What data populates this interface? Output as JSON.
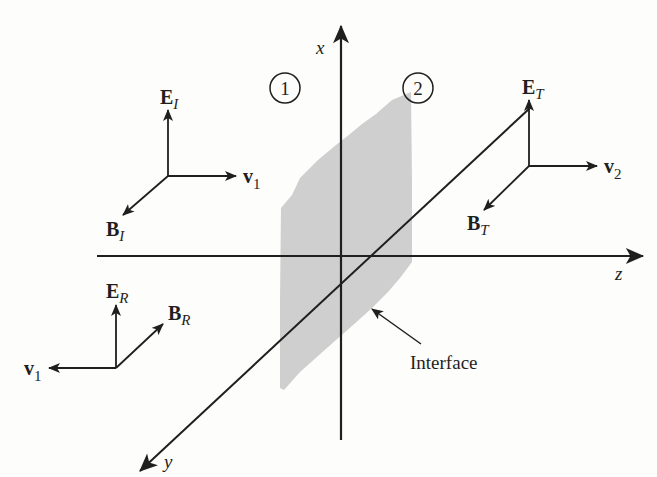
{
  "figure": {
    "colors": {
      "ink": "#1f1f1f",
      "interface_fill": "#cfcfcf",
      "background": "#fdfdfb"
    },
    "axes": {
      "x_label": "x",
      "y_label": "y",
      "z_label": "z"
    },
    "regions": {
      "medium1": "1",
      "medium2": "2"
    },
    "interface_label": "Interface",
    "incident": {
      "E_main": "E",
      "E_sub": "I",
      "B_main": "B",
      "B_sub": "I",
      "v_main": "v",
      "v_sub": "1"
    },
    "reflected": {
      "E_main": "E",
      "E_sub": "R",
      "B_main": "B",
      "B_sub": "R",
      "v_main": "v",
      "v_sub": "1"
    },
    "transmitted": {
      "E_main": "E",
      "E_sub": "T",
      "B_main": "B",
      "B_sub": "T",
      "v_main": "v",
      "v_sub": "2"
    }
  }
}
